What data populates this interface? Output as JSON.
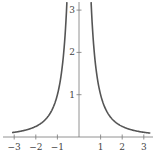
{
  "chart_data": {
    "type": "line",
    "title": "",
    "function": "y = 1/x^2",
    "xlabel": "",
    "ylabel": "",
    "xlim": [
      -3.1,
      3.3
    ],
    "ylim": [
      0,
      3.2
    ],
    "grid": false,
    "legend": null,
    "x_ticks": [
      -3,
      -2,
      -1,
      1,
      2,
      3
    ],
    "x_tick_labels": [
      "−3",
      "−2",
      "−1",
      "1",
      "2",
      "3"
    ],
    "y_ticks": [
      1,
      2,
      3
    ],
    "y_tick_labels": [
      "1",
      "2",
      "3"
    ],
    "series": [
      {
        "name": "left branch",
        "x": [
          -3.1,
          -3,
          -2.5,
          -2,
          -1.5,
          -1.25,
          -1,
          -0.9,
          -0.8,
          -0.7,
          -0.6,
          -0.56
        ],
        "y": [
          0.104,
          0.111,
          0.16,
          0.25,
          0.444,
          0.64,
          1.0,
          1.235,
          1.5625,
          2.041,
          2.778,
          3.19
        ]
      },
      {
        "name": "right branch",
        "x": [
          0.56,
          0.6,
          0.7,
          0.8,
          0.9,
          1,
          1.25,
          1.5,
          2,
          2.5,
          3,
          3.3
        ],
        "y": [
          3.19,
          2.778,
          2.041,
          1.5625,
          1.235,
          1.0,
          0.64,
          0.444,
          0.25,
          0.16,
          0.111,
          0.092
        ]
      }
    ],
    "colors": {
      "curve": "#555555",
      "axis": "#777777",
      "text": "#444444"
    }
  }
}
